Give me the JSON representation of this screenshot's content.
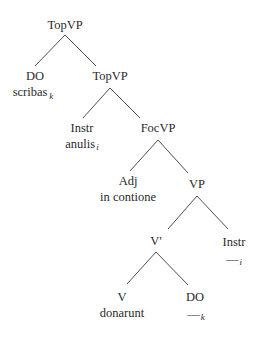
{
  "tree": {
    "nodes": [
      {
        "id": "n1",
        "label": "TopVP",
        "word": "",
        "index": "",
        "x": 65,
        "y": 29
      },
      {
        "id": "n2",
        "label": "DO",
        "word": "scribas",
        "index": "k",
        "x": 35,
        "y": 80
      },
      {
        "id": "n3",
        "label": "TopVP",
        "word": "",
        "index": "",
        "x": 110,
        "y": 80
      },
      {
        "id": "n4",
        "label": "Instr",
        "word": "anulis",
        "index": "i",
        "x": 82,
        "y": 132
      },
      {
        "id": "n5",
        "label": "FocVP",
        "word": "",
        "index": "",
        "x": 158,
        "y": 132
      },
      {
        "id": "n6",
        "label": "Adj",
        "word": "in contione",
        "index": "",
        "x": 128,
        "y": 185
      },
      {
        "id": "n7",
        "label": "VP",
        "word": "",
        "index": "",
        "x": 197,
        "y": 188
      },
      {
        "id": "n8",
        "label": "V'",
        "word": "",
        "index": "",
        "x": 156,
        "y": 245
      },
      {
        "id": "n9",
        "label": "Instr",
        "word": "—",
        "index": "i",
        "x": 234,
        "y": 246
      },
      {
        "id": "n10",
        "label": "V",
        "word": "donarunt",
        "index": "",
        "x": 122,
        "y": 301
      },
      {
        "id": "n11",
        "label": "DO",
        "word": "—",
        "index": "k",
        "x": 195,
        "y": 301
      }
    ],
    "edges": [
      [
        "n1",
        "n2"
      ],
      [
        "n1",
        "n3"
      ],
      [
        "n3",
        "n4"
      ],
      [
        "n3",
        "n5"
      ],
      [
        "n5",
        "n6"
      ],
      [
        "n5",
        "n7"
      ],
      [
        "n7",
        "n8"
      ],
      [
        "n7",
        "n9"
      ],
      [
        "n8",
        "n10"
      ],
      [
        "n8",
        "n11"
      ]
    ]
  }
}
